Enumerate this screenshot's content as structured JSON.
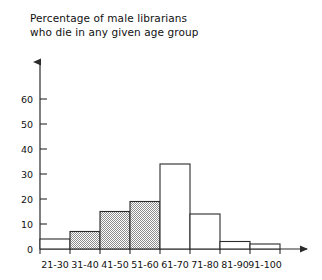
{
  "chart_data": {
    "type": "bar",
    "title": "Percentage of male librarians who die in any given age group",
    "title_line_1": "Percentage of male librarians",
    "title_line_2": "who die in any given age group",
    "xlabel": "",
    "ylabel": "",
    "categories": [
      "21-30",
      "31-40",
      "41-50",
      "51-60",
      "61-70",
      "71-80",
      "81-90",
      "91-100"
    ],
    "values": [
      4,
      7,
      15,
      19,
      34,
      14,
      3,
      2
    ],
    "bar_fill": [
      "white",
      "shaded",
      "shaded",
      "shaded",
      "white",
      "white",
      "white",
      "white"
    ],
    "ylim": [
      0,
      68
    ],
    "ytick_labels": [
      "0",
      "10",
      "20",
      "30",
      "40",
      "50",
      "60"
    ],
    "ytick_values": [
      0,
      10,
      20,
      30,
      40,
      50,
      60
    ],
    "grid": false,
    "legend": "none",
    "colors": {
      "axis": "#2b2b2b",
      "bar_outline": "#2b2b2b",
      "bar_shaded": "#9a9a9a",
      "bar_white": "#ffffff",
      "text": "#111111",
      "background": "#ffffff"
    }
  }
}
